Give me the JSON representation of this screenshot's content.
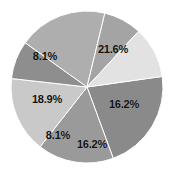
{
  "chart_data": {
    "type": "pie",
    "title": "",
    "subtitle": "",
    "xlabel": "",
    "ylabel": "",
    "legend": "none",
    "grid": false,
    "units": "percent",
    "label_format": "{value}%",
    "background_color": "#ffffff",
    "label_text_color": "#111111",
    "center_x": 87,
    "center_y": 87,
    "radius": 76,
    "start_angle_deg": -8,
    "direction": "clockwise",
    "categories": [
      "Slice 1",
      "Slice 2",
      "Slice 3",
      "Slice 4",
      "Slice 5",
      "Slice 6",
      "Slice 7"
    ],
    "values": [
      21.6,
      16.2,
      16.2,
      8.1,
      18.9,
      8.1,
      10.9
    ],
    "colors": [
      "#8a8a8a",
      "#9a9a9a",
      "#c9c9c9",
      "#8e8e8e",
      "#aeaeae",
      "#a4a4a4",
      "#e2e2e2"
    ],
    "slices": [
      {
        "name": "Slice 1",
        "value": 21.6,
        "label": "21.6%",
        "color": "#8a8a8a",
        "start_deg": -8,
        "sweep_deg": 77.8,
        "label_x": 113,
        "label_y": 49,
        "labelled": true
      },
      {
        "name": "Slice 2",
        "value": 16.2,
        "label": "16.2%",
        "color": "#9a9a9a",
        "start_deg": 69.8,
        "sweep_deg": 58.3,
        "label_x": 124,
        "label_y": 104,
        "labelled": true
      },
      {
        "name": "Slice 3",
        "value": 16.2,
        "label": "16.2%",
        "color": "#c9c9c9",
        "start_deg": 128.1,
        "sweep_deg": 58.3,
        "label_x": 92,
        "label_y": 144,
        "labelled": true
      },
      {
        "name": "Slice 4",
        "value": 8.1,
        "label": "8.1%",
        "color": "#8e8e8e",
        "start_deg": 186.4,
        "sweep_deg": 29.2,
        "label_x": 58,
        "label_y": 135,
        "labelled": true
      },
      {
        "name": "Slice 5",
        "value": 18.9,
        "label": "18.9%",
        "color": "#aeaeae",
        "start_deg": 215.6,
        "sweep_deg": 68.0,
        "label_x": 47,
        "label_y": 99,
        "labelled": true
      },
      {
        "name": "Slice 6",
        "value": 8.1,
        "label": "8.1%",
        "color": "#a4a4a4",
        "start_deg": 283.6,
        "sweep_deg": 29.2,
        "label_x": 45,
        "label_y": 56,
        "labelled": true
      },
      {
        "name": "Slice 7",
        "value": 10.9,
        "label": "",
        "color": "#e2e2e2",
        "start_deg": 312.8,
        "sweep_deg": 39.2,
        "label_x": 74,
        "label_y": 32,
        "labelled": false
      }
    ]
  }
}
